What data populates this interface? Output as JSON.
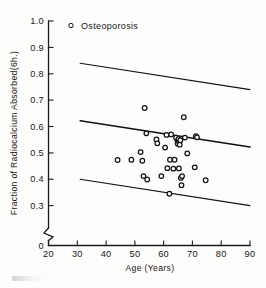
{
  "figure": {
    "background_color": "#fdfdfc",
    "ink_color": "#141414"
  },
  "legend": {
    "position": "top-left-inside",
    "entries": [
      {
        "label": "Osteoporosis",
        "marker": "open-circle-marker"
      }
    ]
  },
  "axes": {
    "y": {
      "label": "Fraction of Radiocalcium Absorbed(6h.)",
      "ticks": [
        "1.0",
        "0.9",
        "0.8",
        "0.7",
        "0.6",
        "0.5",
        "0.4",
        "0.3",
        "0"
      ],
      "has_break": true,
      "break_between": [
        "0.3",
        "0"
      ]
    },
    "x": {
      "label": "Age (Years)",
      "ticks": [
        "20",
        "30",
        "40",
        "50",
        "60",
        "70",
        "80",
        "90"
      ]
    }
  },
  "chart_data": {
    "type": "scatter",
    "title": "",
    "xlabel": "Age (Years)",
    "ylabel": "Fraction of Radiocalcium Absorbed(6h.)",
    "xlim": [
      20,
      90
    ],
    "ylim": [
      0.3,
      1.0
    ],
    "y_axis_break": true,
    "y_axis_zero_shown": true,
    "grid": false,
    "legend_position": "upper left",
    "series": [
      {
        "name": "Osteoporosis",
        "marker": "open circle",
        "points": [
          [
            44.0,
            0.473
          ],
          [
            48.8,
            0.474
          ],
          [
            52.0,
            0.503
          ],
          [
            52.6,
            0.47
          ],
          [
            53.4,
            0.67
          ],
          [
            53.0,
            0.412
          ],
          [
            54.3,
            0.399
          ],
          [
            54.0,
            0.574
          ],
          [
            57.5,
            0.551
          ],
          [
            57.8,
            0.536
          ],
          [
            59.2,
            0.412
          ],
          [
            60.5,
            0.52
          ],
          [
            61.0,
            0.568
          ],
          [
            61.3,
            0.442
          ],
          [
            62.0,
            0.345
          ],
          [
            62.2,
            0.474
          ],
          [
            62.6,
            0.57
          ],
          [
            63.4,
            0.44
          ],
          [
            63.8,
            0.474
          ],
          [
            64.3,
            0.558
          ],
          [
            64.8,
            0.545
          ],
          [
            64.9,
            0.535
          ],
          [
            65.2,
            0.553
          ],
          [
            65.4,
            0.54
          ],
          [
            65.6,
            0.531
          ],
          [
            65.8,
            0.548
          ],
          [
            65.3,
            0.441
          ],
          [
            66.0,
            0.405
          ],
          [
            66.4,
            0.412
          ],
          [
            66.2,
            0.377
          ],
          [
            67.0,
            0.635
          ],
          [
            67.4,
            0.558
          ],
          [
            68.2,
            0.498
          ],
          [
            70.8,
            0.445
          ],
          [
            71.2,
            0.563
          ],
          [
            71.6,
            0.559
          ],
          [
            74.6,
            0.396
          ]
        ]
      }
    ],
    "lines": [
      {
        "name": "upper-limit-line",
        "role": "upper confidence bound",
        "x": [
          31,
          90
        ],
        "y": [
          0.84,
          0.74
        ]
      },
      {
        "name": "regression-line",
        "role": "mean regression",
        "x": [
          31,
          90
        ],
        "y": [
          0.622,
          0.522
        ]
      },
      {
        "name": "lower-limit-line",
        "role": "lower confidence bound",
        "x": [
          31,
          90
        ],
        "y": [
          0.4,
          0.3
        ]
      }
    ]
  }
}
